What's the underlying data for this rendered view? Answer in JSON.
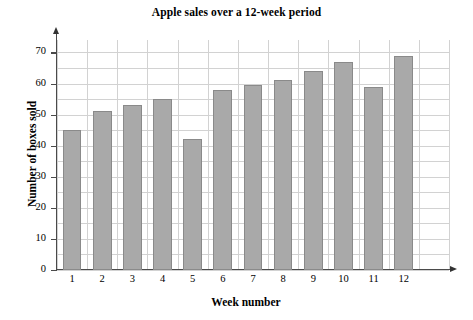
{
  "chart_data": {
    "type": "bar",
    "title": "Apple sales over a 12-week period",
    "xlabel": "Week number",
    "ylabel": "Number of boxes sold",
    "categories": [
      "1",
      "2",
      "3",
      "4",
      "5",
      "6",
      "7",
      "8",
      "9",
      "10",
      "11",
      "12"
    ],
    "values": [
      45,
      51,
      53,
      55,
      42,
      58,
      59.5,
      61,
      64,
      67,
      59,
      69
    ],
    "ylim": [
      0,
      74
    ],
    "y_ticks": [
      0,
      10,
      20,
      30,
      40,
      50,
      60,
      70
    ],
    "y_tick_labels": [
      "0",
      "10",
      "20",
      "30",
      "40",
      "50",
      "60",
      "70"
    ],
    "grid": true,
    "grid_minor_y_step": 5,
    "legend": null,
    "bar_color": "#a9a9a9",
    "bar_edge_color": "#8a8a8a",
    "grid_color": "#d2d2d2",
    "axis_color": "#4a4a4a",
    "background": "#ffffff"
  }
}
